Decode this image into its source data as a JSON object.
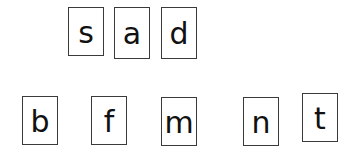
{
  "word_row": {
    "cards": [
      {
        "letter": "s",
        "x": 68,
        "y": 7,
        "w": 36,
        "h": 49
      },
      {
        "letter": "a",
        "x": 114,
        "y": 7,
        "w": 36,
        "h": 52
      },
      {
        "letter": "d",
        "x": 161,
        "y": 7,
        "w": 36,
        "h": 52
      }
    ]
  },
  "choice_row": {
    "cards": [
      {
        "letter": "b",
        "x": 22,
        "y": 96,
        "w": 36,
        "h": 49
      },
      {
        "letter": "f",
        "x": 91,
        "y": 96,
        "w": 36,
        "h": 49
      },
      {
        "letter": "m",
        "x": 161,
        "y": 97,
        "w": 36,
        "h": 49
      },
      {
        "letter": "n",
        "x": 243,
        "y": 97,
        "w": 36,
        "h": 49
      },
      {
        "letter": "t",
        "x": 302,
        "y": 93,
        "w": 36,
        "h": 49
      }
    ]
  },
  "colors": {
    "border": "#3a3a3a",
    "text": "#111111",
    "background": "#ffffff"
  }
}
